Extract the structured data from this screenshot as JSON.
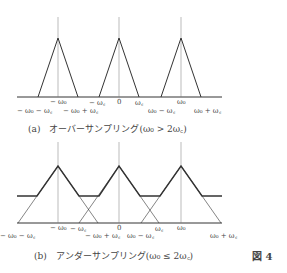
{
  "figure_label": "図 4",
  "panel_a": {
    "caption": "(a)　オーバーサンプリング(ω₀ > 2ω꜀)",
    "labels": {
      "neg_w0": "− ω₀",
      "neg_wc": "− ω꜀",
      "zero": "0",
      "wc": "ω꜀",
      "w0": "ω₀",
      "neg_w0_minus_wc": "− ω₀ − ω꜀",
      "neg_w0_plus_wc": "− ω₀ + ω꜀",
      "w0_minus_wc": "ω₀ − ω꜀",
      "w0_plus_wc": "ω₀ + ω꜀"
    }
  },
  "panel_b": {
    "caption": "(b)　アンダーサンプリング(ω₀ ≤ 2ω꜀)",
    "labels": {
      "neg_w0": "− ω₀",
      "neg_wc": "− ω꜀",
      "zero": "0",
      "wc": "ω꜀",
      "w0": "ω₀",
      "neg_w0_minus_wc": "− ω₀ − ω꜀",
      "neg_w0_plus_wc": "− ω₀ + ω꜀",
      "w0_minus_wc": "ω₀ − ω꜀",
      "w0_plus_wc": "ω₀ + ω꜀"
    }
  }
}
